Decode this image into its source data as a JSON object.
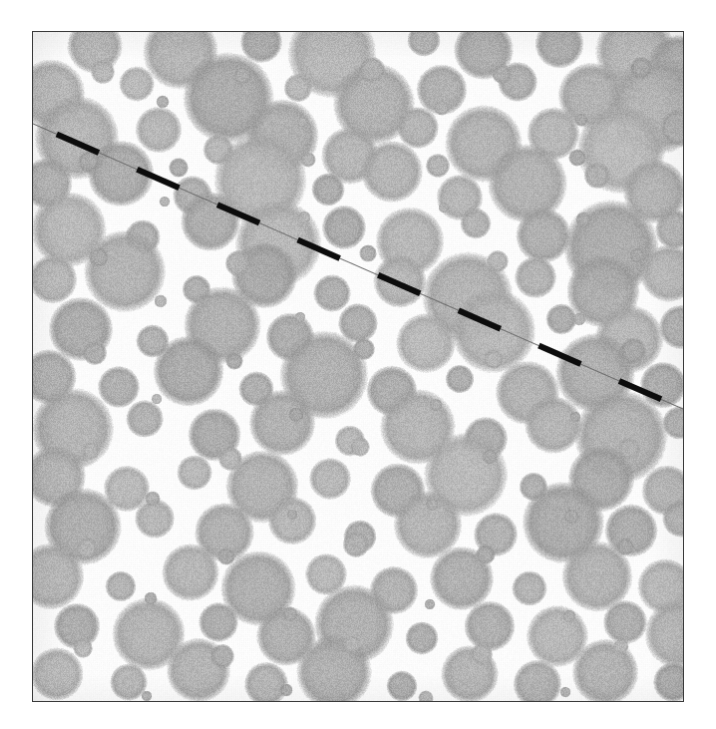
{
  "figure": {
    "domain_label": "grayscale micrograph",
    "caption": "",
    "background_color": "#ffffff",
    "panel": {
      "x": 32,
      "y": 31,
      "width": 652,
      "height": 671,
      "border_color": "#3a3a3a",
      "border_width_px": 1.4,
      "field_color": "#fdfdfd"
    },
    "particles": {
      "fill_color": "#a9a9a9",
      "edge_softness": "fuzzy",
      "texture": "speckled-noise",
      "count": 268,
      "radius_range_px": [
        4,
        52
      ],
      "description": "randomly distributed circular gray blobs of varying size on a white field"
    },
    "scale_line": {
      "style": "dashed",
      "color": "#0d0d0d",
      "hairline_color": "#6e6e6e",
      "start": {
        "x": 0,
        "y": 92
      },
      "end": {
        "x": 652,
        "y": 378
      },
      "thick_dash_px": 46,
      "thin_gap_px": 42,
      "thick_width_px": 6,
      "thin_width_px": 1.1,
      "description": "diagonal dashed line from upper-left edge to lower-right edge"
    }
  },
  "chart_data": {
    "type": "scatter",
    "title": "",
    "subtitle": "",
    "xlabel": "",
    "ylabel": "",
    "xlim": [
      0,
      652
    ],
    "ylim": [
      0,
      671
    ],
    "grid": false,
    "legend": null,
    "annotations": [
      {
        "name": "diagonal-dashed-line",
        "kind": "line",
        "x": [
          0,
          652
        ],
        "y": [
          92,
          378
        ],
        "color": "#0d0d0d",
        "dashed": true
      }
    ],
    "series": [
      {
        "name": "particles",
        "marker": "circle",
        "color": "#a9a9a9",
        "points": [
          [
            62,
            14,
            25
          ],
          [
            148,
            20,
            34
          ],
          [
            229,
            10,
            19
          ],
          [
            300,
            22,
            40
          ],
          [
            392,
            8,
            15
          ],
          [
            452,
            18,
            27
          ],
          [
            528,
            12,
            22
          ],
          [
            604,
            20,
            36
          ],
          [
            648,
            34,
            28
          ],
          [
            18,
            62,
            31
          ],
          [
            104,
            52,
            16
          ],
          [
            196,
            66,
            41
          ],
          [
            266,
            56,
            13
          ],
          [
            342,
            72,
            37
          ],
          [
            410,
            58,
            23
          ],
          [
            486,
            50,
            18
          ],
          [
            560,
            64,
            30
          ],
          [
            626,
            74,
            44
          ],
          [
            44,
            106,
            38
          ],
          [
            126,
            98,
            21
          ],
          [
            186,
            118,
            14
          ],
          [
            250,
            104,
            33
          ],
          [
            318,
            124,
            26
          ],
          [
            386,
            96,
            19
          ],
          [
            452,
            112,
            35
          ],
          [
            522,
            102,
            24
          ],
          [
            590,
            118,
            40
          ],
          [
            648,
            96,
            17
          ],
          [
            14,
            152,
            23
          ],
          [
            88,
            142,
            30
          ],
          [
            160,
            164,
            18
          ],
          [
            228,
            148,
            42
          ],
          [
            296,
            158,
            15
          ],
          [
            360,
            140,
            28
          ],
          [
            428,
            166,
            21
          ],
          [
            496,
            152,
            36
          ],
          [
            566,
            144,
            12
          ],
          [
            624,
            160,
            29
          ],
          [
            36,
            198,
            34
          ],
          [
            110,
            206,
            16
          ],
          [
            178,
            190,
            27
          ],
          [
            246,
            212,
            39
          ],
          [
            312,
            196,
            20
          ],
          [
            378,
            210,
            31
          ],
          [
            444,
            192,
            14
          ],
          [
            512,
            204,
            25
          ],
          [
            580,
            216,
            43
          ],
          [
            644,
            198,
            18
          ],
          [
            20,
            248,
            22
          ],
          [
            92,
            240,
            37
          ],
          [
            164,
            258,
            13
          ],
          [
            232,
            244,
            30
          ],
          [
            300,
            262,
            17
          ],
          [
            368,
            250,
            24
          ],
          [
            436,
            266,
            41
          ],
          [
            504,
            246,
            19
          ],
          [
            572,
            260,
            33
          ],
          [
            638,
            242,
            26
          ],
          [
            48,
            298,
            29
          ],
          [
            120,
            310,
            15
          ],
          [
            190,
            294,
            35
          ],
          [
            258,
            306,
            22
          ],
          [
            326,
            292,
            18
          ],
          [
            394,
            312,
            27
          ],
          [
            462,
            300,
            38
          ],
          [
            530,
            288,
            14
          ],
          [
            598,
            308,
            31
          ],
          [
            650,
            296,
            20
          ],
          [
            16,
            346,
            25
          ],
          [
            86,
            356,
            19
          ],
          [
            156,
            340,
            32
          ],
          [
            224,
            358,
            16
          ],
          [
            292,
            344,
            40
          ],
          [
            360,
            360,
            23
          ],
          [
            428,
            348,
            13
          ],
          [
            496,
            362,
            29
          ],
          [
            564,
            342,
            36
          ],
          [
            632,
            354,
            21
          ],
          [
            40,
            398,
            37
          ],
          [
            112,
            388,
            17
          ],
          [
            182,
            404,
            24
          ],
          [
            250,
            392,
            30
          ],
          [
            318,
            410,
            14
          ],
          [
            386,
            396,
            34
          ],
          [
            454,
            408,
            20
          ],
          [
            522,
            394,
            26
          ],
          [
            590,
            406,
            42
          ],
          [
            648,
            392,
            15
          ],
          [
            22,
            446,
            28
          ],
          [
            94,
            458,
            21
          ],
          [
            162,
            442,
            16
          ],
          [
            230,
            456,
            33
          ],
          [
            298,
            448,
            19
          ],
          [
            366,
            460,
            25
          ],
          [
            434,
            444,
            38
          ],
          [
            502,
            456,
            13
          ],
          [
            570,
            448,
            30
          ],
          [
            636,
            460,
            23
          ],
          [
            50,
            496,
            35
          ],
          [
            122,
            488,
            18
          ],
          [
            192,
            502,
            27
          ],
          [
            260,
            490,
            22
          ],
          [
            328,
            506,
            15
          ],
          [
            396,
            494,
            31
          ],
          [
            464,
            504,
            20
          ],
          [
            532,
            492,
            37
          ],
          [
            600,
            500,
            24
          ],
          [
            650,
            488,
            17
          ],
          [
            18,
            546,
            30
          ],
          [
            88,
            556,
            14
          ],
          [
            158,
            542,
            26
          ],
          [
            226,
            558,
            34
          ],
          [
            294,
            544,
            19
          ],
          [
            362,
            560,
            22
          ],
          [
            430,
            548,
            29
          ],
          [
            498,
            558,
            16
          ],
          [
            566,
            546,
            32
          ],
          [
            634,
            556,
            25
          ],
          [
            44,
            596,
            21
          ],
          [
            116,
            604,
            33
          ],
          [
            186,
            592,
            18
          ],
          [
            254,
            606,
            27
          ],
          [
            322,
            594,
            36
          ],
          [
            390,
            608,
            15
          ],
          [
            458,
            596,
            23
          ],
          [
            526,
            606,
            28
          ],
          [
            594,
            592,
            20
          ],
          [
            648,
            604,
            31
          ],
          [
            24,
            644,
            24
          ],
          [
            96,
            652,
            17
          ],
          [
            166,
            640,
            29
          ],
          [
            234,
            654,
            20
          ],
          [
            302,
            642,
            34
          ],
          [
            370,
            656,
            14
          ],
          [
            438,
            644,
            26
          ],
          [
            506,
            654,
            22
          ],
          [
            574,
            642,
            30
          ],
          [
            642,
            652,
            18
          ],
          [
            70,
            40,
            11
          ],
          [
            210,
            44,
            8
          ],
          [
            340,
            38,
            12
          ],
          [
            470,
            42,
            9
          ],
          [
            610,
            36,
            10
          ],
          [
            56,
            130,
            10
          ],
          [
            146,
            136,
            9
          ],
          [
            276,
            128,
            7
          ],
          [
            406,
            134,
            11
          ],
          [
            546,
            126,
            8
          ],
          [
            66,
            226,
            9
          ],
          [
            206,
            232,
            12
          ],
          [
            336,
            222,
            8
          ],
          [
            466,
            230,
            10
          ],
          [
            606,
            224,
            7
          ],
          [
            62,
            322,
            11
          ],
          [
            202,
            330,
            8
          ],
          [
            332,
            318,
            10
          ],
          [
            462,
            328,
            9
          ],
          [
            602,
            320,
            12
          ],
          [
            58,
            420,
            8
          ],
          [
            198,
            428,
            11
          ],
          [
            328,
            416,
            9
          ],
          [
            458,
            426,
            7
          ],
          [
            598,
            418,
            10
          ],
          [
            54,
            518,
            10
          ],
          [
            194,
            526,
            8
          ],
          [
            324,
            514,
            12
          ],
          [
            454,
            524,
            9
          ],
          [
            594,
            516,
            8
          ],
          [
            50,
            618,
            9
          ],
          [
            190,
            626,
            11
          ],
          [
            320,
            614,
            8
          ],
          [
            450,
            624,
            10
          ],
          [
            590,
            616,
            7
          ],
          [
            130,
            70,
            6
          ],
          [
            270,
            90,
            5
          ],
          [
            410,
            76,
            7
          ],
          [
            550,
            88,
            6
          ],
          [
            132,
            170,
            5
          ],
          [
            272,
            186,
            6
          ],
          [
            412,
            176,
            5
          ],
          [
            552,
            188,
            7
          ],
          [
            128,
            270,
            6
          ],
          [
            268,
            286,
            5
          ],
          [
            408,
            276,
            7
          ],
          [
            548,
            288,
            6
          ],
          [
            124,
            368,
            5
          ],
          [
            264,
            384,
            7
          ],
          [
            404,
            374,
            6
          ],
          [
            544,
            386,
            5
          ],
          [
            120,
            468,
            7
          ],
          [
            260,
            484,
            5
          ],
          [
            400,
            474,
            6
          ],
          [
            540,
            486,
            7
          ],
          [
            118,
            568,
            6
          ],
          [
            258,
            584,
            7
          ],
          [
            398,
            574,
            5
          ],
          [
            538,
            586,
            6
          ],
          [
            114,
            666,
            5
          ],
          [
            254,
            660,
            6
          ],
          [
            394,
            668,
            7
          ],
          [
            534,
            662,
            5
          ]
        ]
      }
    ]
  }
}
